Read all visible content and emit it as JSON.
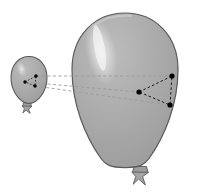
{
  "figure": {
    "description": "A small grey balloon on the left and a large grey balloon on the right, each containing a dotted triangle of three marked points; dashed lines connect corresponding points between the two balloons.",
    "background_color": "#ffffff"
  },
  "style": {
    "balloon_fill": "#a8a8a8",
    "balloon_fill_light": "#b4b4b4",
    "balloon_stroke": "#5a5a5a",
    "highlight_color": "#e8e8e8",
    "knot_fill": "#9a9a9a",
    "knot_stroke": "#5a5a5a",
    "point_color": "#000000",
    "triangle_edge_color": "#1a1a1a",
    "correspondence_line_color": "#9a9a9a"
  },
  "small_balloon": {
    "label": "small-balloon",
    "center_x": 29,
    "center_y": 80,
    "body_width": 35,
    "body_height": 48,
    "knot_x": 27,
    "knot_y": 106,
    "triangle": {
      "label": "small-triangle",
      "points": [
        {
          "name": "point-a",
          "x": 25,
          "y": 82
        },
        {
          "name": "point-b",
          "x": 36,
          "y": 76
        },
        {
          "name": "point-c",
          "x": 35,
          "y": 86
        }
      ]
    }
  },
  "large_balloon": {
    "label": "large-balloon",
    "center_x": 125,
    "center_y": 92,
    "body_width": 106,
    "body_height": 158,
    "knot_x": 140,
    "knot_y": 172,
    "triangle": {
      "label": "large-triangle",
      "points": [
        {
          "name": "point-a",
          "x": 139,
          "y": 92
        },
        {
          "name": "point-b",
          "x": 172,
          "y": 76
        },
        {
          "name": "point-c",
          "x": 170,
          "y": 105
        }
      ]
    }
  },
  "correspondence_lines": [
    {
      "name": "line-b",
      "x1": 36,
      "y1": 76,
      "x2": 172,
      "y2": 76
    },
    {
      "name": "line-a",
      "x1": 25,
      "y1": 82,
      "x2": 139,
      "y2": 92
    },
    {
      "name": "line-c",
      "x1": 35,
      "y1": 86,
      "x2": 170,
      "y2": 105
    }
  ]
}
